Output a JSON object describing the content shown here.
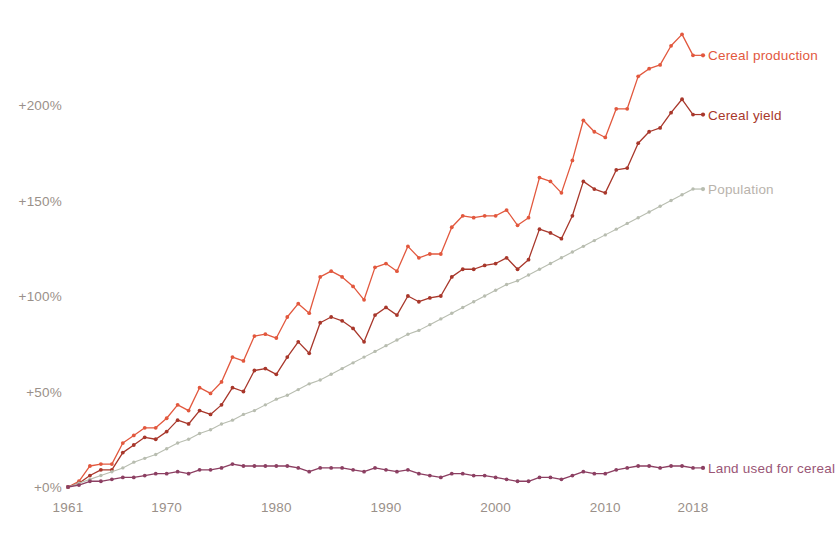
{
  "chart_data": {
    "type": "line",
    "title": "",
    "subtitle": "",
    "xlabel": "",
    "ylabel": "",
    "xlim": [
      1961,
      2018
    ],
    "ylim": [
      -10,
      240
    ],
    "grid": false,
    "legend_position": "right-inline-end-of-line",
    "y_ticks": [
      0,
      50,
      100,
      150,
      200
    ],
    "y_tick_labels": [
      "+0%",
      "+50%",
      "+100%",
      "+150%",
      "+200%"
    ],
    "x_ticks": [
      1961,
      1970,
      1980,
      1990,
      2000,
      2010,
      2018
    ],
    "x_tick_labels": [
      "1961",
      "1970",
      "1980",
      "1990",
      "2000",
      "2010",
      "2018"
    ],
    "x": [
      1961,
      1962,
      1963,
      1964,
      1965,
      1966,
      1967,
      1968,
      1969,
      1970,
      1971,
      1972,
      1973,
      1974,
      1975,
      1976,
      1977,
      1978,
      1979,
      1980,
      1981,
      1982,
      1983,
      1984,
      1985,
      1986,
      1987,
      1988,
      1989,
      1990,
      1991,
      1992,
      1993,
      1994,
      1995,
      1996,
      1997,
      1998,
      1999,
      2000,
      2001,
      2002,
      2003,
      2004,
      2005,
      2006,
      2007,
      2008,
      2009,
      2010,
      2011,
      2012,
      2013,
      2014,
      2015,
      2016,
      2017,
      2018
    ],
    "series": [
      {
        "name": "Cereal production",
        "color": "#e2583e",
        "label_color": "#e2583e",
        "values": [
          0,
          3,
          11,
          12,
          12,
          23,
          27,
          31,
          31,
          36,
          43,
          40,
          52,
          49,
          55,
          68,
          66,
          79,
          80,
          78,
          89,
          96,
          91,
          110,
          113,
          110,
          105,
          98,
          115,
          117,
          113,
          126,
          120,
          122,
          122,
          136,
          142,
          141,
          142,
          142,
          145,
          137,
          141,
          162,
          160,
          154,
          171,
          192,
          186,
          183,
          198,
          198,
          215,
          219,
          221,
          231,
          237,
          226
        ]
      },
      {
        "name": "Cereal yield",
        "color": "#a8372b",
        "label_color": "#a8372b",
        "values": [
          0,
          2,
          6,
          9,
          9,
          18,
          22,
          26,
          25,
          29,
          35,
          33,
          40,
          38,
          43,
          52,
          50,
          61,
          62,
          59,
          68,
          76,
          70,
          86,
          89,
          87,
          83,
          76,
          90,
          94,
          90,
          100,
          97,
          99,
          100,
          110,
          114,
          114,
          116,
          117,
          120,
          114,
          119,
          135,
          133,
          130,
          142,
          160,
          156,
          154,
          166,
          167,
          180,
          186,
          188,
          196,
          203,
          195
        ]
      },
      {
        "name": "Population",
        "color": "#b8bdb0",
        "label_color": "#b9b3ac",
        "values": [
          0,
          2,
          4,
          6,
          8,
          10,
          13,
          15,
          17,
          20,
          23,
          25,
          28,
          30,
          33,
          35,
          38,
          40,
          43,
          46,
          48,
          51,
          54,
          56,
          59,
          62,
          65,
          68,
          71,
          74,
          77,
          80,
          82,
          85,
          88,
          91,
          94,
          97,
          100,
          103,
          106,
          108,
          111,
          114,
          117,
          120,
          123,
          126,
          129,
          132,
          135,
          138,
          141,
          144,
          147,
          150,
          153,
          156
        ]
      },
      {
        "name": "Land used for cereal",
        "color": "#8c3f62",
        "label_color": "#9a5676",
        "values": [
          0,
          1,
          3,
          3,
          4,
          5,
          5,
          6,
          7,
          7,
          8,
          7,
          9,
          9,
          10,
          12,
          11,
          11,
          11,
          11,
          11,
          10,
          8,
          10,
          10,
          10,
          9,
          8,
          10,
          9,
          8,
          9,
          7,
          6,
          5,
          7,
          7,
          6,
          6,
          5,
          4,
          3,
          3,
          5,
          5,
          4,
          6,
          8,
          7,
          7,
          9,
          10,
          11,
          11,
          10,
          11,
          11,
          10
        ]
      }
    ],
    "series_end_labels": [
      {
        "name": "Cereal production"
      },
      {
        "name": "Cereal yield"
      },
      {
        "name": "Population"
      },
      {
        "name": "Land used for cereal"
      }
    ]
  }
}
